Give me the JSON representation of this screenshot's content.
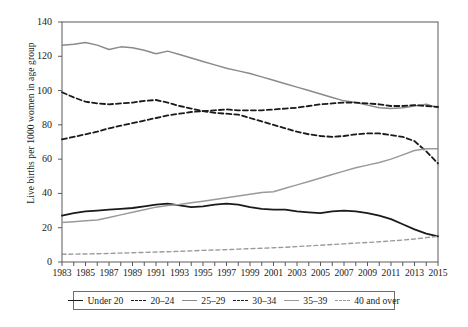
{
  "chart_data": {
    "type": "line",
    "title": "",
    "xlabel": "",
    "ylabel": "Live births per 1000 women in age group",
    "xlim": [
      1983,
      2015
    ],
    "ylim": [
      0,
      140
    ],
    "yticks": [
      0,
      20,
      40,
      60,
      80,
      100,
      120,
      140
    ],
    "xticks": [
      1983,
      1985,
      1987,
      1989,
      1991,
      1993,
      1995,
      1997,
      1999,
      2001,
      2003,
      2005,
      2007,
      2009,
      2011,
      2013,
      2015
    ],
    "xtick_labels": [
      "1983",
      "1985",
      "1987",
      "1989",
      "1991",
      "1993",
      "1995",
      "1997",
      "1999",
      "2001",
      "2003",
      "2005",
      "2007",
      "2009",
      "2011",
      "2013",
      "2015"
    ],
    "ytick_labels": [
      "0",
      "20",
      "40",
      "60",
      "80",
      "100",
      "120",
      "140"
    ],
    "grid": false,
    "legend_position": "bottom",
    "x": [
      1983,
      1984,
      1985,
      1986,
      1987,
      1988,
      1989,
      1990,
      1991,
      1992,
      1993,
      1994,
      1995,
      1996,
      1997,
      1998,
      1999,
      2000,
      2001,
      2002,
      2003,
      2004,
      2005,
      2006,
      2007,
      2008,
      2009,
      2010,
      2011,
      2012,
      2013,
      2014,
      2015
    ],
    "series": [
      {
        "name": "Under 20",
        "color": "#1a1a1a",
        "style": "solid",
        "width": 1.8,
        "values": [
          27,
          28.5,
          29.5,
          30,
          30.5,
          31,
          31.5,
          32.5,
          33.5,
          34,
          33,
          32,
          32.5,
          33.5,
          34,
          33.5,
          32,
          31,
          30.5,
          30.5,
          29.5,
          29,
          28.5,
          29.5,
          30,
          29.5,
          28.5,
          27,
          25,
          22,
          19,
          16.5,
          15
        ]
      },
      {
        "name": "20-24",
        "color": "#1a1a1a",
        "style": "dashed",
        "width": 1.8,
        "values": [
          99,
          96,
          93.5,
          92.5,
          92,
          92.5,
          93,
          94,
          94.5,
          93,
          91,
          89.5,
          88,
          87,
          86.5,
          86,
          84,
          82,
          80,
          78,
          76,
          74.5,
          73.5,
          73,
          73.5,
          74.5,
          75,
          75,
          74,
          73,
          70.5,
          64.5,
          57.5
        ]
      },
      {
        "name": "25-29",
        "color": "#8a8a8a",
        "style": "solid",
        "width": 1.5,
        "values": [
          126.5,
          127,
          128,
          126.5,
          124,
          125.5,
          125,
          123.5,
          121.5,
          123,
          121,
          119,
          117,
          115,
          113,
          111.5,
          110,
          108,
          106,
          104,
          102,
          100,
          98,
          96,
          94,
          93,
          91.5,
          90,
          89.5,
          90,
          91,
          92,
          90
        ]
      },
      {
        "name": "30-34",
        "color": "#1a1a1a",
        "style": "dashed",
        "width": 1.8,
        "values": [
          71.5,
          73,
          74.5,
          76,
          78,
          79.5,
          81,
          82.5,
          84,
          85.5,
          86.5,
          87.5,
          88,
          88.5,
          89,
          88.5,
          88.5,
          88.5,
          89,
          89.5,
          90,
          91,
          92,
          92.5,
          93,
          93,
          92.5,
          92,
          91,
          91,
          91.5,
          91,
          90.5
        ]
      },
      {
        "name": "35-39",
        "color": "#9a9a9a",
        "style": "solid",
        "width": 1.5,
        "values": [
          23,
          23.5,
          24,
          24.5,
          26,
          27.5,
          29,
          30.5,
          32,
          33,
          33.5,
          34.5,
          35.5,
          36.5,
          37.5,
          38.5,
          39.5,
          40.5,
          41,
          43,
          45,
          47,
          49,
          51,
          53,
          55,
          56.5,
          58,
          60,
          62.5,
          65,
          66,
          66
        ]
      },
      {
        "name": "40 and over",
        "color": "#9a9a9a",
        "style": "dashed",
        "width": 1.4,
        "values": [
          4.5,
          4.6,
          4.7,
          4.8,
          5,
          5.2,
          5.4,
          5.6,
          5.8,
          6,
          6.2,
          6.5,
          6.8,
          7,
          7.2,
          7.5,
          7.8,
          8,
          8.3,
          8.6,
          9,
          9.4,
          9.8,
          10.2,
          10.6,
          11,
          11.4,
          11.8,
          12.3,
          12.8,
          13.4,
          14.2,
          15
        ]
      }
    ]
  },
  "legend": {
    "items": [
      {
        "label": "Under 20",
        "swatch": "sw-solid-black"
      },
      {
        "label": "20–24",
        "swatch": "sw-dash-black"
      },
      {
        "label": "25–29",
        "swatch": "sw-solid-gray"
      },
      {
        "label": "30–34",
        "swatch": "sw-dash-black"
      },
      {
        "label": "35–39",
        "swatch": "sw-solid-gray2"
      },
      {
        "label": "40 and over",
        "swatch": "sw-dash-gray"
      }
    ]
  },
  "axes": {
    "y_title": "Live births per 1000 women in age group",
    "frame_color": "#5a5a5a"
  }
}
